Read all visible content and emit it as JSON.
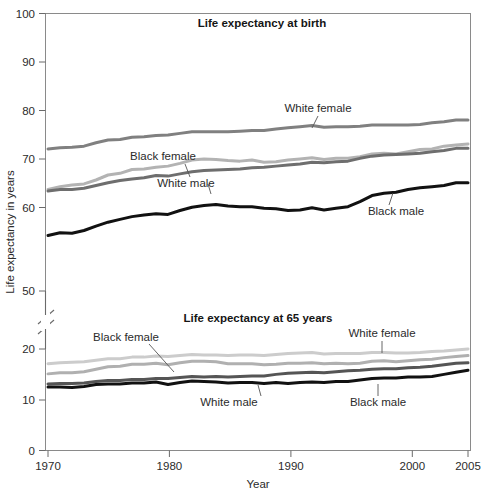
{
  "chart_data": {
    "type": "line",
    "title": "",
    "xlabel": "Year",
    "ylabel": "Life expectancy in years",
    "grid": false,
    "legend_position": "inline-annotations",
    "xlim": [
      1970,
      2005
    ],
    "xticks": [
      1970,
      1980,
      1990,
      2000,
      2005
    ],
    "xticklabels": [
      "1970",
      "1980",
      "1990",
      "2000",
      "2005"
    ],
    "yticks": [
      0,
      10,
      20,
      50,
      60,
      70,
      80,
      90,
      100
    ],
    "yticklabels": [
      "0",
      "10",
      "20",
      "50",
      "60",
      "70",
      "80",
      "90",
      "100"
    ],
    "y_axis_break": {
      "between": [
        20,
        50
      ],
      "note": "broken axis"
    },
    "panels": [
      {
        "name": "at-birth",
        "title": "Life expectancy at birth",
        "ylim": [
          50,
          100
        ],
        "x": [
          1970,
          1971,
          1972,
          1973,
          1974,
          1975,
          1976,
          1977,
          1978,
          1979,
          1980,
          1981,
          1982,
          1983,
          1984,
          1985,
          1986,
          1987,
          1988,
          1989,
          1990,
          1991,
          1992,
          1993,
          1994,
          1995,
          1996,
          1997,
          1998,
          1999,
          2000,
          2001,
          2002,
          2003,
          2004,
          2005
        ],
        "series": [
          {
            "name": "White female",
            "color": "#808080",
            "values": [
              75.6,
              75.8,
              75.9,
              76.1,
              76.7,
              77.2,
              77.3,
              77.7,
              77.8,
              78.0,
              78.1,
              78.4,
              78.7,
              78.7,
              78.7,
              78.7,
              78.8,
              78.9,
              78.9,
              79.2,
              79.4,
              79.6,
              79.8,
              79.5,
              79.6,
              79.6,
              79.7,
              79.9,
              79.9,
              79.9,
              79.9,
              80.0,
              80.3,
              80.5,
              80.8,
              80.8
            ]
          },
          {
            "name": "Black female",
            "color": "#b3b3b3",
            "values": [
              68.3,
              68.8,
              69.1,
              69.3,
              70.0,
              70.9,
              71.2,
              71.9,
              72.0,
              72.3,
              72.5,
              73.0,
              73.6,
              73.8,
              73.7,
              73.5,
              73.4,
              73.6,
              73.2,
              73.3,
              73.6,
              73.8,
              74.0,
              73.7,
              73.9,
              73.9,
              74.2,
              74.7,
              74.8,
              74.7,
              75.1,
              75.5,
              75.6,
              76.1,
              76.3,
              76.5
            ]
          },
          {
            "name": "White male",
            "color": "#6e6e6e",
            "values": [
              68.0,
              68.3,
              68.3,
              68.5,
              69.0,
              69.5,
              69.9,
              70.2,
              70.4,
              70.8,
              70.7,
              71.1,
              71.5,
              71.7,
              71.8,
              71.9,
              72.0,
              72.2,
              72.3,
              72.5,
              72.7,
              72.9,
              73.2,
              73.1,
              73.3,
              73.4,
              73.9,
              74.3,
              74.5,
              74.6,
              74.7,
              74.8,
              75.1,
              75.3,
              75.7,
              75.7
            ]
          },
          {
            "name": "Black male",
            "color": "#111111",
            "values": [
              60.0,
              60.5,
              60.4,
              60.9,
              61.7,
              62.4,
              62.9,
              63.4,
              63.7,
              63.9,
              63.8,
              64.5,
              65.1,
              65.4,
              65.6,
              65.3,
              65.2,
              65.2,
              64.9,
              64.8,
              64.5,
              64.6,
              65.0,
              64.6,
              64.9,
              65.2,
              66.1,
              67.2,
              67.6,
              67.8,
              68.3,
              68.6,
              68.8,
              69.0,
              69.5,
              69.5
            ]
          }
        ]
      },
      {
        "name": "at-65",
        "title": "Life expectancy at 65 years",
        "ylim": [
          0,
          20
        ],
        "x": [
          1970,
          1971,
          1972,
          1973,
          1974,
          1975,
          1976,
          1977,
          1978,
          1979,
          1980,
          1981,
          1982,
          1983,
          1984,
          1985,
          1986,
          1987,
          1988,
          1989,
          1990,
          1991,
          1992,
          1993,
          1994,
          1995,
          1996,
          1997,
          1998,
          1999,
          2000,
          2001,
          2002,
          2003,
          2004,
          2005
        ],
        "series": [
          {
            "name": "White female",
            "color": "#cccccc",
            "values": [
              17.1,
              17.3,
              17.4,
              17.5,
              17.8,
              18.1,
              18.1,
              18.4,
              18.4,
              18.6,
              18.5,
              18.7,
              18.9,
              18.8,
              18.8,
              18.7,
              18.8,
              18.8,
              18.7,
              18.9,
              19.1,
              19.2,
              19.3,
              19.0,
              19.1,
              19.1,
              19.1,
              19.3,
              19.3,
              19.2,
              19.2,
              19.3,
              19.5,
              19.6,
              19.8,
              20.0
            ]
          },
          {
            "name": "Black female",
            "color": "#b0b0b0",
            "values": [
              15.1,
              15.3,
              15.3,
              15.5,
              16.0,
              16.5,
              16.6,
              17.0,
              17.0,
              17.2,
              16.9,
              17.3,
              17.6,
              17.6,
              17.5,
              17.1,
              17.1,
              17.1,
              16.9,
              17.0,
              17.2,
              17.2,
              17.3,
              17.1,
              17.2,
              17.1,
              17.2,
              17.6,
              17.7,
              17.5,
              17.7,
              17.9,
              18.0,
              18.3,
              18.5,
              18.7
            ]
          },
          {
            "name": "White male",
            "color": "#555555",
            "values": [
              13.1,
              13.2,
              13.2,
              13.3,
              13.6,
              13.8,
              13.8,
              14.0,
              14.0,
              14.2,
              14.2,
              14.4,
              14.6,
              14.5,
              14.6,
              14.5,
              14.6,
              14.7,
              14.7,
              15.0,
              15.2,
              15.3,
              15.4,
              15.3,
              15.5,
              15.7,
              15.8,
              16.0,
              16.1,
              16.1,
              16.3,
              16.4,
              16.6,
              16.9,
              17.2,
              17.3
            ]
          },
          {
            "name": "Black male",
            "color": "#111111",
            "values": [
              12.5,
              12.5,
              12.4,
              12.6,
              13.0,
              13.1,
              13.1,
              13.3,
              13.3,
              13.5,
              13.0,
              13.4,
              13.7,
              13.6,
              13.5,
              13.3,
              13.4,
              13.4,
              13.2,
              13.4,
              13.2,
              13.4,
              13.5,
              13.4,
              13.6,
              13.6,
              13.9,
              14.2,
              14.3,
              14.3,
              14.5,
              14.5,
              14.6,
              15.0,
              15.4,
              15.8
            ]
          }
        ]
      }
    ],
    "annotations": [
      {
        "text": "White female",
        "panel": "at-birth"
      },
      {
        "text": "Black female",
        "panel": "at-birth"
      },
      {
        "text": "White male",
        "panel": "at-birth"
      },
      {
        "text": "Black male",
        "panel": "at-birth"
      },
      {
        "text": "White female",
        "panel": "at-65"
      },
      {
        "text": "Black female",
        "panel": "at-65"
      },
      {
        "text": "White male",
        "panel": "at-65"
      },
      {
        "text": "Black male",
        "panel": "at-65"
      }
    ]
  },
  "axis": {
    "ylabel": "Life expectancy in years",
    "xlabel": "Year",
    "yticklabels": [
      "100",
      "90",
      "80",
      "70",
      "60",
      "50",
      "20",
      "10",
      "0"
    ],
    "xticklabels": [
      "1970",
      "1980",
      "1990",
      "2000",
      "2005"
    ]
  },
  "titles": {
    "upper": "Life expectancy at birth",
    "lower": "Life expectancy at 65 years"
  },
  "labels": {
    "upper_white_female": "White female",
    "upper_black_female": "Black female",
    "upper_white_male": "White male",
    "upper_black_male": "Black male",
    "lower_white_female": "White female",
    "lower_black_female": "Black female",
    "lower_white_male": "White male",
    "lower_black_male": "Black male"
  },
  "colors": {
    "white_female_birth": "#808080",
    "black_female_birth": "#b3b3b3",
    "white_male_birth": "#6e6e6e",
    "black_male_birth": "#111111",
    "white_female_65": "#cccccc",
    "black_female_65": "#b0b0b0",
    "white_male_65": "#555555",
    "black_male_65": "#111111",
    "frame": "#8a8a8a",
    "text": "#2b2b2b"
  }
}
